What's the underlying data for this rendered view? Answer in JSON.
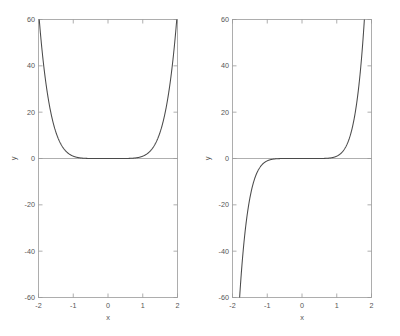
{
  "figure": {
    "background": "#ffffff",
    "axis_color": "#9a9a9a",
    "curve_color": "#4a4a4a",
    "text_color": "#555555"
  },
  "chart_data": [
    {
      "panel": "left",
      "type": "line",
      "title": "",
      "xlabel": "x",
      "ylabel": "y",
      "xlim": [
        -2,
        2
      ],
      "ylim": [
        -60,
        60
      ],
      "xticks": [
        -2,
        -1,
        0,
        1,
        2
      ],
      "xticklabels": [
        "-2",
        "-1",
        "0",
        "1",
        "2"
      ],
      "yticks": [
        -60,
        -40,
        -20,
        0,
        20,
        40,
        60
      ],
      "yticklabels": [
        "-60",
        "-40",
        "-20",
        "0",
        "20",
        "40",
        "60"
      ],
      "grid": false,
      "legend": null,
      "series": [
        {
          "name": "y = x^6",
          "expression": "x^6",
          "x": [
            -2.0,
            -1.8,
            -1.6,
            -1.4,
            -1.2,
            -1.0,
            -0.8,
            -0.6,
            -0.4,
            -0.2,
            0.0,
            0.2,
            0.4,
            0.6,
            0.8,
            1.0,
            1.1,
            1.2,
            1.3,
            1.4,
            1.5,
            1.6,
            1.7,
            1.75,
            1.8,
            1.85,
            1.9,
            1.92
          ],
          "y": [
            64.0,
            34.0,
            16.8,
            7.5,
            3.0,
            1.0,
            0.26,
            0.05,
            0.004,
            0.0,
            0.0,
            0.0,
            0.004,
            0.05,
            0.26,
            1.0,
            1.77,
            3.0,
            4.83,
            7.53,
            11.39,
            16.78,
            24.14,
            28.72,
            34.01,
            40.13,
            47.05,
            50.12
          ],
          "clipped_at_top_x": 1.93,
          "note": "Curve is visually flat along y = 0 for x below about 0.6, then rises steeply and exits the top of the axes near x = 1.93"
        }
      ]
    },
    {
      "panel": "right",
      "type": "line",
      "title": "",
      "xlabel": "x",
      "ylabel": "y",
      "xlim": [
        -2,
        2
      ],
      "ylim": [
        -60,
        60
      ],
      "xticks": [
        -2,
        -1,
        0,
        1,
        2
      ],
      "xticklabels": [
        "-2",
        "-1",
        "0",
        "1",
        "2"
      ],
      "yticks": [
        -60,
        -40,
        -20,
        0,
        20,
        40,
        60
      ],
      "yticklabels": [
        "-60",
        "-40",
        "-20",
        "0",
        "20",
        "40",
        "60"
      ],
      "grid": false,
      "legend": null,
      "series": [
        {
          "name": "y = x^7",
          "expression": "x^7",
          "x": [
            -1.93,
            -1.9,
            -1.85,
            -1.8,
            -1.7,
            -1.6,
            -1.5,
            -1.4,
            -1.3,
            -1.2,
            -1.1,
            -1.0,
            -0.8,
            -0.6,
            -0.4,
            -0.2,
            0.0,
            0.2,
            0.4,
            0.6,
            0.8,
            1.0,
            1.1,
            1.2,
            1.3,
            1.4,
            1.5,
            1.6,
            1.7,
            1.8,
            1.85,
            1.9,
            1.93
          ],
          "y": [
            -60.0,
            -56.0,
            -49.2,
            -42.0,
            -31.0,
            -26.8,
            -17.1,
            -10.5,
            -6.3,
            -3.6,
            -1.95,
            -1.0,
            -0.21,
            -0.028,
            -0.0016,
            0.0,
            0.0,
            0.0,
            0.0016,
            0.028,
            0.21,
            1.0,
            1.95,
            3.6,
            6.3,
            10.5,
            17.1,
            26.8,
            41.0,
            61.2,
            70.0,
            80.0,
            60.0
          ],
          "clipped_at_top_x": 1.93,
          "clipped_at_bottom_x": -1.96,
          "note": "Odd symmetric curve through the origin; flat along y = 0 between roughly x = -0.6 and x = 0.6, exits the bottom of the axes near x = -1.96 and the top near x = 1.93"
        }
      ]
    }
  ]
}
